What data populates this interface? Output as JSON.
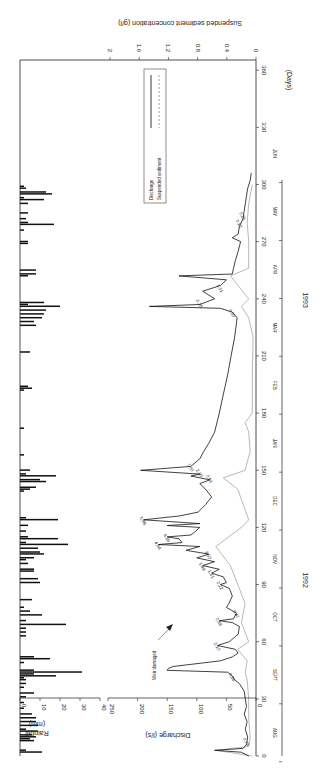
{
  "chart_data": {
    "type": "line",
    "orientation": "rotated 90 degrees (days axis vertical, values increase leftward)",
    "title": "",
    "xlabel": "(Days)",
    "x_ticks": [
      0,
      30,
      60,
      90,
      120,
      150,
      180,
      210,
      240,
      270,
      300,
      330,
      360
    ],
    "x_range": [
      0,
      360
    ],
    "months": [
      "AUG",
      "SEPT",
      "OCT",
      "NOV",
      "DEC",
      "JAN",
      "FEB",
      "MAR",
      "APR",
      "MAY",
      "JUN"
    ],
    "years": [
      "1992",
      "1993"
    ],
    "panels": [
      {
        "name": "rainfall",
        "type": "bar",
        "ylabel": "Rainfall (mm)",
        "y_ticks": [
          0,
          10,
          20,
          30,
          40
        ],
        "ylim": [
          0,
          40
        ],
        "bars_day_mm": [
          [
            2,
            11
          ],
          [
            3,
            3
          ],
          [
            8,
            7
          ],
          [
            9,
            5
          ],
          [
            10,
            8
          ],
          [
            11,
            6
          ],
          [
            13,
            9
          ],
          [
            14,
            3
          ],
          [
            16,
            9
          ],
          [
            18,
            8
          ],
          [
            20,
            8
          ],
          [
            22,
            6
          ],
          [
            25,
            2
          ],
          [
            28,
            2
          ],
          [
            31,
            3
          ],
          [
            33,
            7
          ],
          [
            36,
            2
          ],
          [
            38,
            3
          ],
          [
            40,
            3
          ],
          [
            41,
            2
          ],
          [
            42,
            18
          ],
          [
            43,
            7
          ],
          [
            44,
            31
          ],
          [
            45,
            7
          ],
          [
            49,
            2
          ],
          [
            51,
            15
          ],
          [
            52,
            7
          ],
          [
            63,
            3
          ],
          [
            65,
            3
          ],
          [
            67,
            3
          ],
          [
            69,
            23
          ],
          [
            71,
            3
          ],
          [
            74,
            11
          ],
          [
            76,
            5
          ],
          [
            78,
            2
          ],
          [
            82,
            6
          ],
          [
            91,
            10
          ],
          [
            93,
            9
          ],
          [
            97,
            7
          ],
          [
            98,
            7
          ],
          [
            101,
            4
          ],
          [
            103,
            3
          ],
          [
            104,
            7
          ],
          [
            106,
            12
          ],
          [
            107,
            10
          ],
          [
            109,
            9
          ],
          [
            111,
            24
          ],
          [
            112,
            3
          ],
          [
            114,
            19
          ],
          [
            115,
            4
          ],
          [
            118,
            3
          ],
          [
            121,
            4
          ],
          [
            124,
            19
          ],
          [
            125,
            3
          ],
          [
            139,
            2
          ],
          [
            140,
            5
          ],
          [
            141,
            8
          ],
          [
            144,
            13
          ],
          [
            145,
            10
          ],
          [
            147,
            18
          ],
          [
            148,
            3
          ],
          [
            150,
            5
          ],
          [
            158,
            2
          ],
          [
            172,
            2
          ],
          [
            192,
            2
          ],
          [
            193,
            6
          ],
          [
            194,
            4
          ],
          [
            212,
            5
          ],
          [
            226,
            8
          ],
          [
            228,
            7
          ],
          [
            230,
            11
          ],
          [
            232,
            12
          ],
          [
            234,
            13
          ],
          [
            236,
            20
          ],
          [
            237,
            4
          ],
          [
            238,
            12
          ],
          [
            252,
            4
          ],
          [
            253,
            8
          ],
          [
            255,
            8
          ],
          [
            269,
            4
          ],
          [
            270,
            4
          ],
          [
            276,
            2
          ],
          [
            279,
            17
          ],
          [
            280,
            4
          ],
          [
            282,
            3
          ],
          [
            285,
            4
          ],
          [
            290,
            4
          ],
          [
            292,
            12
          ],
          [
            293,
            2
          ],
          [
            295,
            16
          ],
          [
            296,
            13
          ],
          [
            298,
            3
          ],
          [
            299,
            2
          ]
        ]
      },
      {
        "name": "discharge_and_sediment",
        "ylabel": "Discharge (l/s)",
        "y_ticks": [
          0,
          50,
          100,
          150,
          200,
          250
        ],
        "ylim": [
          0,
          250
        ],
        "y2label": "Suspended sediment concentration (g/l)",
        "y2_ticks": [
          0,
          0.4,
          0.8,
          1.2,
          1.6,
          2
        ],
        "y2lim": [
          0,
          2
        ],
        "legend": [
          "Discharge",
          "Suspended sediment"
        ],
        "legend_position": "upper right (rotated)",
        "series": [
          {
            "name": "Discharge",
            "style": "solid",
            "points_day_value": [
              [
                0,
                12
              ],
              [
                2,
                25
              ],
              [
                3,
                70
              ],
              [
                4,
                22
              ],
              [
                6,
                16
              ],
              [
                10,
                14
              ],
              [
                14,
                18
              ],
              [
                18,
                15
              ],
              [
                22,
                20
              ],
              [
                26,
                16
              ],
              [
                30,
                18
              ],
              [
                34,
                20
              ],
              [
                38,
                28
              ],
              [
                40,
                36
              ],
              [
                42,
                40
              ],
              [
                44,
                48
              ],
              [
                45,
                150
              ],
              [
                46,
                148
              ],
              [
                47,
                140
              ],
              [
                50,
                60
              ],
              [
                52,
                40
              ],
              [
                54,
                30
              ],
              [
                56,
                35
              ],
              [
                58,
                65
              ],
              [
                60,
                45
              ],
              [
                64,
                30
              ],
              [
                68,
                28
              ],
              [
                70,
                40
              ],
              [
                71,
                62
              ],
              [
                72,
                38
              ],
              [
                75,
                33
              ],
              [
                78,
                50
              ],
              [
                80,
                46
              ],
              [
                84,
                40
              ],
              [
                88,
                45
              ],
              [
                90,
                60
              ],
              [
                91,
                50
              ],
              [
                94,
                55
              ],
              [
                96,
                75
              ],
              [
                98,
                62
              ],
              [
                100,
                90
              ],
              [
                102,
                70
              ],
              [
                104,
                100
              ],
              [
                106,
                80
              ],
              [
                108,
                118
              ],
              [
                110,
                95
              ],
              [
                111,
                165
              ],
              [
                112,
                125
              ],
              [
                114,
                130
              ],
              [
                115,
                150
              ],
              [
                116,
                110
              ],
              [
                118,
                102
              ],
              [
                120,
                95
              ],
              [
                121,
                150
              ],
              [
                122,
                95
              ],
              [
                124,
                190
              ],
              [
                126,
                130
              ],
              [
                128,
                98
              ],
              [
                132,
                85
              ],
              [
                136,
                75
              ],
              [
                140,
                85
              ],
              [
                143,
                95
              ],
              [
                145,
                78
              ],
              [
                147,
                110
              ],
              [
                148,
                95
              ],
              [
                150,
                195
              ],
              [
                152,
                110
              ],
              [
                156,
                95
              ],
              [
                160,
                88
              ],
              [
                164,
                80
              ],
              [
                170,
                70
              ],
              [
                180,
                62
              ],
              [
                190,
                55
              ],
              [
                200,
                48
              ],
              [
                210,
                42
              ],
              [
                220,
                36
              ],
              [
                230,
                32
              ],
              [
                233,
                40
              ],
              [
                235,
                60
              ],
              [
                236,
                180
              ],
              [
                237,
                95
              ],
              [
                240,
                70
              ],
              [
                244,
                90
              ],
              [
                247,
                60
              ],
              [
                250,
                50
              ],
              [
                252,
                130
              ],
              [
                253,
                40
              ],
              [
                256,
                38
              ],
              [
                260,
                35
              ],
              [
                265,
                30
              ],
              [
                270,
                26
              ],
              [
                272,
                40
              ],
              [
                274,
                30
              ],
              [
                278,
                28
              ],
              [
                282,
                22
              ],
              [
                286,
                20
              ],
              [
                290,
                18
              ],
              [
                294,
                16
              ],
              [
                298,
                14
              ],
              [
                302,
                10
              ],
              [
                306,
                8
              ]
            ]
          },
          {
            "name": "Suspended sediment",
            "style": "dashed/grey",
            "points_day_value_gl": [
              [
                0,
                0.05
              ],
              [
                3,
                0.55
              ],
              [
                5,
                0.1
              ],
              [
                10,
                0.08
              ],
              [
                20,
                0.1
              ],
              [
                30,
                0.1
              ],
              [
                40,
                0.12
              ],
              [
                44,
                0.15
              ],
              [
                50,
                0.12
              ],
              [
                56,
                0.25
              ],
              [
                60,
                0.1
              ],
              [
                70,
                0.2
              ],
              [
                80,
                0.15
              ],
              [
                90,
                0.25
              ],
              [
                100,
                0.35
              ],
              [
                110,
                0.55
              ],
              [
                120,
                0.2
              ],
              [
                124,
                0.1
              ],
              [
                140,
                0.25
              ],
              [
                146,
                0.45
              ],
              [
                150,
                0.15
              ],
              [
                160,
                0.08
              ],
              [
                170,
                0.1
              ],
              [
                175,
                0.15
              ],
              [
                180,
                0.05
              ],
              [
                200,
                0.05
              ],
              [
                220,
                0.04
              ],
              [
                230,
                0.1
              ],
              [
                236,
                0.2
              ],
              [
                240,
                0.1
              ],
              [
                252,
                0.35
              ],
              [
                256,
                0.1
              ],
              [
                270,
                0.1
              ],
              [
                280,
                0.12
              ],
              [
                290,
                0.1
              ],
              [
                300,
                0.05
              ]
            ]
          }
        ],
        "annotations": [
          {
            "day": 8,
            "text": "0.78"
          },
          {
            "day": 42,
            "text": "0.88"
          },
          {
            "day": 58,
            "text": "2.10"
          },
          {
            "day": 71,
            "text": "0.88"
          },
          {
            "day": 75,
            "text": "0.47"
          },
          {
            "day": 90,
            "text": "2.22"
          },
          {
            "day": 96,
            "text": "1.31"
          },
          {
            "day": 100,
            "text": "1.49"
          },
          {
            "day": 106,
            "text": "3.50"
          },
          {
            "day": 111,
            "text": "4.88"
          },
          {
            "day": 115,
            "text": "8.39"
          },
          {
            "day": 124,
            "text": "5.96"
          },
          {
            "day": 146,
            "text": "0.61"
          },
          {
            "day": 149,
            "text": "2.90"
          },
          {
            "day": 152,
            "text": "7.00"
          },
          {
            "day": 233,
            "text": "0.50"
          },
          {
            "day": 238,
            "text": "2.28"
          },
          {
            "day": 246,
            "text": "1.31"
          },
          {
            "day": 280,
            "text": "0.10"
          },
          {
            "day": 284,
            "text": "0.25"
          }
        ],
        "callout": {
          "text": "Weir damaged",
          "day": 45
        }
      }
    ]
  },
  "labels": {
    "rainfall_title_1": "Rainfall",
    "rainfall_title_2": "(mm)",
    "discharge_title": "Discharge (l/s)",
    "sediment_title": "Suspended sediment concentration (g/l)",
    "days_title": "(Days)",
    "legend_discharge": "Discharge",
    "legend_sediment": "Suspended sediment",
    "weir_note": "Weir damaged",
    "year_1": "1992",
    "year_2": "1993"
  }
}
